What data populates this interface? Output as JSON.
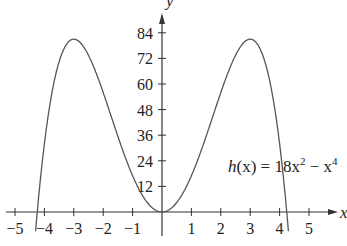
{
  "chart_data": {
    "type": "line",
    "title": "",
    "function_label": "h(x) = 18x² − x⁴",
    "label": {
      "h": "h",
      "rest": "(x) = 18x",
      "exp2": "2",
      "minus": " − x",
      "exp4": "4"
    },
    "xlabel": "x",
    "ylabel": "y",
    "xlim": [
      -5.5,
      5.8
    ],
    "ylim": [
      -6,
      92
    ],
    "x_ticks": [
      -5,
      -4,
      -3,
      -2,
      -1,
      1,
      2,
      3,
      4,
      5
    ],
    "y_ticks": [
      12,
      24,
      36,
      48,
      60,
      72,
      84
    ],
    "grid": false,
    "series": [
      {
        "name": "h(x) = 18x^2 - x^4",
        "x": [
          -4.3,
          -4,
          -3.5,
          -3,
          -2.5,
          -2,
          -1.5,
          -1,
          -0.5,
          0,
          0.5,
          1,
          1.5,
          2,
          2.5,
          3,
          3.5,
          4,
          4.3
        ],
        "y": [
          -8.9,
          32,
          70.4,
          81,
          73.4,
          56,
          35.4,
          17,
          4.4,
          0,
          4.4,
          17,
          35.4,
          56,
          73.4,
          81,
          70.4,
          32,
          -8.9
        ]
      }
    ]
  }
}
